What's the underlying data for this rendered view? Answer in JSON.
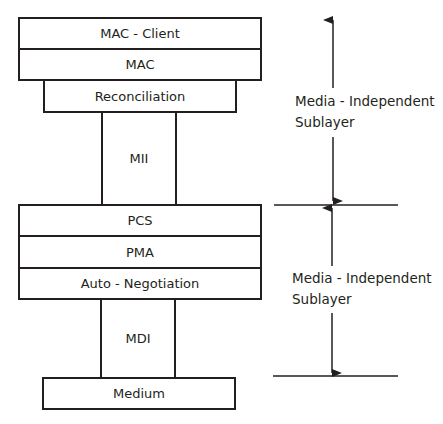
{
  "diagram": {
    "upper_stack": {
      "mac_client": "MAC - Client",
      "mac": "MAC",
      "reconciliation": "Reconciliation",
      "mii": "MII"
    },
    "lower_stack": {
      "pcs": "PCS",
      "pma": "PMA",
      "auto_negotiation": "Auto - Negotiation",
      "mdi": "MDI",
      "medium": "Medium"
    },
    "annotations": [
      {
        "line1": "Media - Independent",
        "line2": "Sublayer"
      },
      {
        "line1": "Media - Independent",
        "line2": "Sublayer"
      }
    ],
    "colors": {
      "stroke": "#231f20",
      "background": "#ffffff"
    }
  }
}
